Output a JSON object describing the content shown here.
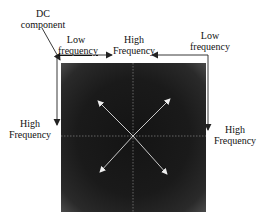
{
  "labels": {
    "dc": [
      "DC",
      "component"
    ],
    "top_left_low": [
      "Low",
      "frequency"
    ],
    "top_center_high": [
      "High",
      "Frequency"
    ],
    "top_right_low": [
      "Low",
      "frequency"
    ],
    "left_high": [
      "High",
      "Frequency"
    ],
    "right_high": [
      "High",
      "Frequency"
    ]
  },
  "colors": {
    "spectrum_bg": "#1a1a1a",
    "arrow_light": "#e8e8e8",
    "line_dark": "#222222"
  }
}
